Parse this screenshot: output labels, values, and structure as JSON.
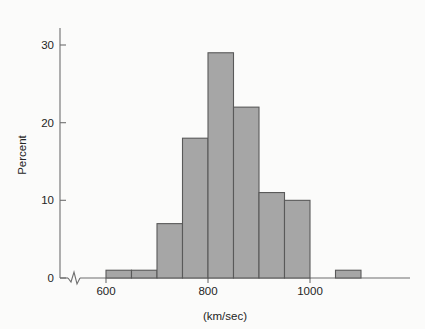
{
  "figure": {
    "background_color": "#fbfbfa",
    "bar_fill_color": "#a6a6a6",
    "bar_edge_color": "#595959",
    "axis_color": "#6e6e6e",
    "text_color": "#242424"
  },
  "labels": {
    "y_axis_title": "Percent",
    "x_axis_title": "(km/sec)",
    "y_tick_0": "0",
    "y_tick_10": "10",
    "y_tick_20": "20",
    "y_tick_30": "30",
    "x_tick_600": "600",
    "x_tick_800": "800",
    "x_tick_1000": "1000"
  },
  "chart_data": {
    "type": "bar",
    "title": "",
    "subtitle": "",
    "xlabel": "(km/sec)",
    "ylabel": "Percent",
    "xlim": [
      585,
      1120
    ],
    "ylim": [
      0,
      32
    ],
    "grid": false,
    "legend": null,
    "axis_break_x": true,
    "bin_width": 50,
    "x_ticks": [
      600,
      800,
      1000
    ],
    "y_ticks": [
      0,
      10,
      20,
      30
    ],
    "categories": [
      "600-650",
      "650-700",
      "700-750",
      "750-800",
      "800-850",
      "850-900",
      "900-950",
      "950-1000",
      "1050-1100"
    ],
    "bin_edges": [
      [
        600,
        650
      ],
      [
        650,
        700
      ],
      [
        700,
        750
      ],
      [
        750,
        800
      ],
      [
        800,
        850
      ],
      [
        850,
        900
      ],
      [
        900,
        950
      ],
      [
        950,
        1000
      ],
      [
        1050,
        1100
      ]
    ],
    "values": [
      1,
      1,
      7,
      18,
      29,
      22,
      11,
      10,
      1
    ],
    "series": [
      {
        "name": "Percent",
        "values": [
          1,
          1,
          7,
          18,
          29,
          22,
          11,
          10,
          1
        ]
      }
    ]
  }
}
